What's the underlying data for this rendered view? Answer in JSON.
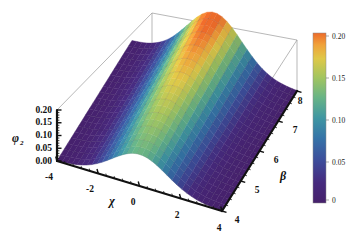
{
  "figure": {
    "kind": "3d-surface-plot",
    "background_color": "#ffffff",
    "frame_color": "#9a9a9a",
    "axis_color": "#111111"
  },
  "axes": {
    "x": {
      "label": "χ",
      "label_name": "chi",
      "ticks": [
        "-4",
        "-2",
        "0",
        "2",
        "4"
      ],
      "values": [
        -4,
        -2,
        0,
        2,
        4
      ],
      "minor_ticks_per_interval": 4,
      "range": [
        -4,
        4
      ]
    },
    "y": {
      "label": "β",
      "label_name": "beta",
      "ticks": [
        "4",
        "5",
        "6",
        "7",
        "8"
      ],
      "values": [
        4,
        5,
        6,
        7,
        8
      ],
      "minor_ticks_per_interval": 4,
      "range": [
        4,
        8
      ]
    },
    "z": {
      "label": "φ",
      "label_sub": "2",
      "label_name": "phi-2",
      "ticks": [
        "0.00",
        "0.05",
        "0.10",
        "0.15",
        "0.20"
      ],
      "values": [
        0.0,
        0.05,
        0.1,
        0.15,
        0.2
      ],
      "minor_ticks_per_interval": 4,
      "range": [
        0.0,
        0.2
      ]
    }
  },
  "colorbar": {
    "ticks": [
      "0.20",
      "0.15",
      "0.10",
      "0.05",
      "0"
    ],
    "values": [
      0.2,
      0.15,
      0.1,
      0.05,
      0.0
    ],
    "min": 0,
    "max": 0.2,
    "orientation": "vertical",
    "stops": [
      {
        "pos": 0.0,
        "color": "#46206b"
      },
      {
        "pos": 0.12,
        "color": "#462a7e"
      },
      {
        "pos": 0.25,
        "color": "#3d4d9b"
      },
      {
        "pos": 0.38,
        "color": "#3573a8"
      },
      {
        "pos": 0.5,
        "color": "#3f96a2"
      },
      {
        "pos": 0.62,
        "color": "#68b486"
      },
      {
        "pos": 0.74,
        "color": "#a3c55f"
      },
      {
        "pos": 0.85,
        "color": "#dfc848"
      },
      {
        "pos": 0.93,
        "color": "#f0a23a"
      },
      {
        "pos": 1.0,
        "color": "#ed6b2a"
      }
    ]
  },
  "chart_data": {
    "type": "surface",
    "title": "",
    "xlabel": "χ",
    "ylabel": "β",
    "zlabel": "φ₂",
    "xlim": [
      -4,
      4
    ],
    "ylim": [
      4,
      8
    ],
    "zlim": [
      0,
      0.2
    ],
    "grid": true,
    "legend": "colorbar-right",
    "colormap": "rainbow",
    "x": [
      -4,
      -3,
      -2,
      -1,
      0,
      1,
      2,
      3,
      4
    ],
    "y": [
      4,
      5,
      6,
      7,
      8
    ],
    "z": [
      [
        0.002,
        0.012,
        0.052,
        0.108,
        0.124,
        0.108,
        0.052,
        0.012,
        0.002
      ],
      [
        0.002,
        0.014,
        0.06,
        0.128,
        0.148,
        0.128,
        0.06,
        0.014,
        0.002
      ],
      [
        0.003,
        0.016,
        0.068,
        0.148,
        0.17,
        0.148,
        0.068,
        0.016,
        0.003
      ],
      [
        0.003,
        0.018,
        0.076,
        0.168,
        0.192,
        0.168,
        0.076,
        0.018,
        0.003
      ],
      [
        0.003,
        0.02,
        0.084,
        0.184,
        0.21,
        0.184,
        0.084,
        0.02,
        0.003
      ]
    ],
    "z_max": 0.21,
    "z_max_at": {
      "chi": 0,
      "beta": 8
    },
    "mesh_lines_x": 33,
    "mesh_lines_y": 21
  }
}
